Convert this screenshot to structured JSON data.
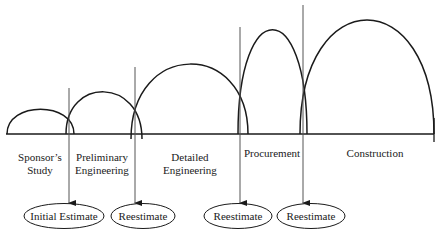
{
  "phases": [
    {
      "id": "sponsors-study",
      "label_line1": "Sponsor’s",
      "label_line2": "Study"
    },
    {
      "id": "preliminary-engineering",
      "label_line1": "Preliminary",
      "label_line2": "Engineering"
    },
    {
      "id": "detailed-engineering",
      "label_line1": "Detailed",
      "label_line2": "Engineering"
    },
    {
      "id": "procurement",
      "label_line1": "Procurement",
      "label_line2": ""
    },
    {
      "id": "construction",
      "label_line1": "Construction",
      "label_line2": ""
    }
  ],
  "estimates": [
    {
      "label": "Initial Estimate"
    },
    {
      "label": "Reestimate"
    },
    {
      "label": "Reestimate"
    },
    {
      "label": "Reestimate"
    }
  ],
  "colors": {
    "line": "#1a1a1a",
    "arrow": "#555555",
    "background": "#ffffff"
  }
}
